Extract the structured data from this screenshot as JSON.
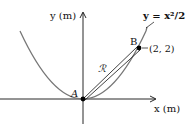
{
  "diagram": {
    "y_axis_label": "y (m)",
    "x_axis_label": "x (m)",
    "curve_label": "y = x²/2",
    "curve_equation": "y = x^2/2",
    "point_A_label": "A",
    "point_B_label": "B",
    "point_B_coords": "(2, 2)",
    "region_label": "ℛ",
    "colors": {
      "axes": "#111111",
      "curve": "#777777",
      "strip": "#111111",
      "points": "#000000"
    }
  }
}
